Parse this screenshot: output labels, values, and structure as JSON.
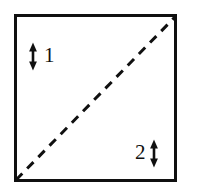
{
  "figure": {
    "title": "",
    "background_color": "#ffffff",
    "stroke_color": "#101010",
    "frame": {
      "name": "square-frame",
      "x": 14,
      "y": 14,
      "width": 162,
      "height": 167,
      "border_width": 3,
      "color": "#101010"
    },
    "diagonal": {
      "name": "dashed-diagonal",
      "from": "bottom-left",
      "to": "top-right",
      "x1": 16,
      "y1": 180,
      "x2": 175,
      "y2": 17,
      "style": "dashed",
      "dash_length": 9,
      "dash_gap": 7,
      "stroke_width": 3,
      "color": "#101010"
    },
    "annotations": [
      {
        "id": "annotation-1",
        "label": "1",
        "arrow_side": "left",
        "arrow": {
          "x": 33,
          "y_top": 44,
          "y_bottom": 69,
          "double_headed": true
        },
        "label_x": 44,
        "label_y": 45
      },
      {
        "id": "annotation-2",
        "label": "2",
        "arrow_side": "right",
        "arrow": {
          "x": 154,
          "y_top": 141,
          "y_bottom": 166,
          "double_headed": true
        },
        "label_x": 135,
        "label_y": 142
      }
    ]
  }
}
